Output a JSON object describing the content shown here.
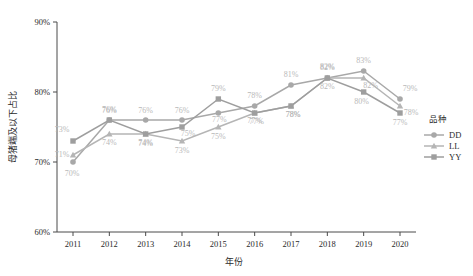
{
  "chart_data": {
    "type": "line",
    "title": "",
    "xlabel": "年份",
    "ylabel": "母猪端及以下占比",
    "categories": [
      "2011",
      "2012",
      "2013",
      "2014",
      "2015",
      "2016",
      "2017",
      "2018",
      "2019",
      "2020"
    ],
    "x": [
      2011,
      2012,
      2013,
      2014,
      2015,
      2016,
      2017,
      2018,
      2019,
      2020
    ],
    "ylim": [
      60,
      90
    ],
    "ytick_labels": [
      "60%",
      "70%",
      "80%",
      "90%"
    ],
    "ytick_values": [
      60,
      70,
      80,
      90
    ],
    "grid": false,
    "legend_position": "right",
    "legend_title": "品种",
    "series": [
      {
        "name": "DD",
        "marker": "circle",
        "color": "#a8a8a8",
        "values": [
          70,
          76,
          76,
          76,
          77,
          78,
          81,
          82,
          83,
          79
        ],
        "labels": [
          "70%",
          "76%",
          "76%",
          "76%",
          "77%",
          "78%",
          "81%",
          "82%",
          "83%",
          "79%"
        ]
      },
      {
        "name": "LL",
        "marker": "triangle",
        "color": "#b5b5b5",
        "values": [
          71,
          74,
          74,
          73,
          75,
          77,
          78,
          82,
          82,
          78
        ],
        "labels": [
          "71%",
          "74%",
          "74%",
          "73%",
          "75%",
          "77%",
          "78%",
          "82%",
          "82%",
          "78%"
        ]
      },
      {
        "name": "YY",
        "marker": "square",
        "color": "#9e9e9e",
        "values": [
          73,
          76,
          74,
          75,
          79,
          77,
          78,
          82,
          80,
          77
        ],
        "labels": [
          "73%",
          "76%",
          "74%",
          "75%",
          "79%",
          "77%",
          "78%",
          "82%",
          "80%",
          "77%"
        ]
      }
    ]
  },
  "axes": {
    "x_title": "年份",
    "y_title": "母猪端及以下占比"
  },
  "legend": {
    "title": "品种",
    "entries": [
      {
        "label": "DD",
        "marker": "circle-marker"
      },
      {
        "label": "LL",
        "marker": "triangle-marker"
      },
      {
        "label": "YY",
        "marker": "square-marker"
      }
    ]
  },
  "colors": {
    "axis": "#4a4a4a",
    "label_text": "#2b2b2b",
    "data_label": "#b9b9b9",
    "series_dd": "#a8a8a8",
    "series_ll": "#b5b5b5",
    "series_yy": "#9e9e9e"
  }
}
